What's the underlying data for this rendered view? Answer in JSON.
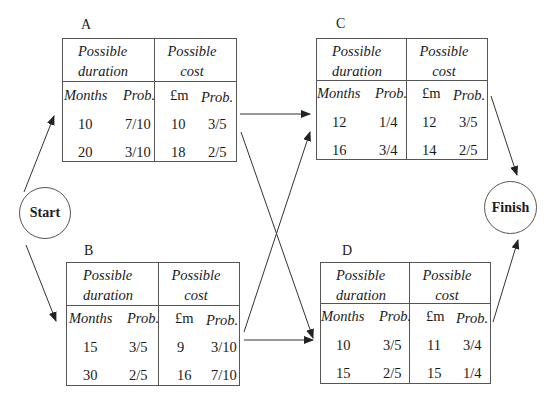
{
  "nodes": {
    "start": {
      "label": "Start"
    },
    "finish": {
      "label": "Finish"
    }
  },
  "headers": {
    "duration": "Possible duration",
    "duration_l1": "Possible",
    "duration_l2": "duration",
    "cost_l1": "Possible",
    "cost_l2": "cost",
    "months": "Months",
    "prob": "Prob.",
    "money": "£m"
  },
  "activities": {
    "A": {
      "label": "A",
      "rows": [
        {
          "months": "10",
          "dprob": "7/10",
          "cost": "10",
          "cprob": "3/5"
        },
        {
          "months": "20",
          "dprob": "3/10",
          "cost": "18",
          "cprob": "2/5"
        }
      ]
    },
    "B": {
      "label": "B",
      "rows": [
        {
          "months": "15",
          "dprob": "3/5",
          "cost": "9",
          "cprob": "3/10"
        },
        {
          "months": "30",
          "dprob": "2/5",
          "cost": "16",
          "cprob": "7/10"
        }
      ]
    },
    "C": {
      "label": "C",
      "rows": [
        {
          "months": "12",
          "dprob": "1/4",
          "cost": "12",
          "cprob": "3/5"
        },
        {
          "months": "16",
          "dprob": "3/4",
          "cost": "14",
          "cprob": "2/5"
        }
      ]
    },
    "D": {
      "label": "D",
      "rows": [
        {
          "months": "10",
          "dprob": "3/5",
          "cost": "11",
          "cprob": "3/4"
        },
        {
          "months": "15",
          "dprob": "2/5",
          "cost": "15",
          "cprob": "1/4"
        }
      ]
    }
  },
  "edges": [
    {
      "from": "Start",
      "to": "A"
    },
    {
      "from": "Start",
      "to": "B"
    },
    {
      "from": "A",
      "to": "C"
    },
    {
      "from": "A",
      "to": "D"
    },
    {
      "from": "B",
      "to": "C"
    },
    {
      "from": "B",
      "to": "D"
    },
    {
      "from": "C",
      "to": "Finish"
    },
    {
      "from": "D",
      "to": "Finish"
    }
  ]
}
